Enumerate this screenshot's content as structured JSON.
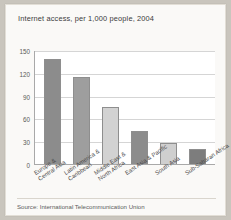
{
  "figure": {
    "source_note": "Source: International Telecommunication Union"
  },
  "chart_data": {
    "type": "bar",
    "title": "Internet access, per 1,000 people, 2004",
    "xlabel": "",
    "ylabel": "",
    "ylim": [
      0,
      150
    ],
    "yticks": [
      0,
      30,
      60,
      90,
      120,
      150
    ],
    "ytick_labels": [
      "0",
      "30",
      "60",
      "90",
      "120",
      "150"
    ],
    "grid": true,
    "legend": false,
    "categories": [
      "Europe &\nCentral Asia",
      "Latin America &\nCaribbean",
      "Middle East &\nNorth Africa",
      "East Asia & Pacific",
      "South Asia",
      "Sub-Saharan Africa"
    ],
    "category_lines": [
      [
        "Europe &",
        "Central Asia"
      ],
      [
        "Latin America &",
        "Caribbean"
      ],
      [
        "Middle East &",
        "North Africa"
      ],
      [
        "East Asia & Pacific"
      ],
      [
        "South Asia"
      ],
      [
        "Sub-Saharan Africa"
      ]
    ],
    "values": [
      138,
      115,
      75,
      43,
      28,
      20
    ],
    "bar_colors": [
      "#8c8c8c",
      "#9e9e9e",
      "#d2d2d2",
      "#8c8c8c",
      "#cfcfcf",
      "#7d7d7d"
    ]
  },
  "colors": {
    "page_background": "#c9c5bd",
    "card_background": "#faf9f7",
    "plot_background": "#ffffff",
    "gridline": "#d5d5d5",
    "axis": "#a9a9a9",
    "text": "#3b3b3b"
  }
}
